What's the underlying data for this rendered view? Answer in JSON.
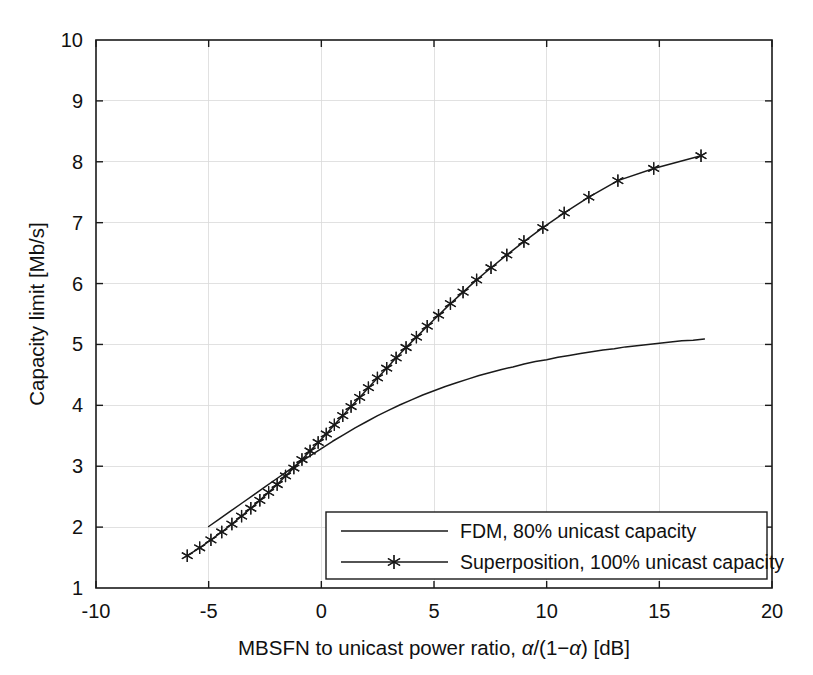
{
  "chart_data": {
    "type": "line",
    "title": "",
    "xlabel": "MBSFN to unicast power ratio, α/(1−α) [dB]",
    "ylabel": "Capacity limit [Mb/s]",
    "xlim": [
      -10,
      20
    ],
    "ylim": [
      1,
      10
    ],
    "xticks": [
      -10,
      -5,
      0,
      5,
      10,
      15,
      20
    ],
    "yticks": [
      1,
      2,
      3,
      4,
      5,
      6,
      7,
      8,
      9,
      10
    ],
    "grid": true,
    "legend_position": "lower right",
    "series": [
      {
        "name": "FDM, 80% unicast capacity",
        "marker": "none",
        "color": "#1a1a1a",
        "x": [
          -5.0,
          -4.5,
          -4.0,
          -3.5,
          -3.0,
          -2.5,
          -2.0,
          -1.5,
          -1.0,
          -0.5,
          0.0,
          0.5,
          1.0,
          1.5,
          2.0,
          2.5,
          3.0,
          3.5,
          4.0,
          4.5,
          5.0,
          5.5,
          6.0,
          6.5,
          7.0,
          7.5,
          8.0,
          8.5,
          9.0,
          9.5,
          10.0,
          10.5,
          11.0,
          11.5,
          12.0,
          12.5,
          13.0,
          13.5,
          14.0,
          14.5,
          15.0,
          15.5,
          16.0,
          16.5,
          17.0
        ],
        "y": [
          2.01,
          2.14,
          2.27,
          2.4,
          2.53,
          2.66,
          2.79,
          2.92,
          3.05,
          3.17,
          3.29,
          3.41,
          3.52,
          3.63,
          3.73,
          3.83,
          3.92,
          4.01,
          4.09,
          4.17,
          4.24,
          4.31,
          4.37,
          4.43,
          4.49,
          4.54,
          4.59,
          4.63,
          4.68,
          4.72,
          4.75,
          4.79,
          4.82,
          4.85,
          4.88,
          4.91,
          4.93,
          4.96,
          4.98,
          5.0,
          5.02,
          5.04,
          5.06,
          5.07,
          5.09
        ]
      },
      {
        "name": "Superposition, 100% unicast capacity",
        "marker": "star",
        "color": "#1a1a1a",
        "x": [
          -5.95,
          -5.4,
          -4.9,
          -4.42,
          -3.97,
          -3.54,
          -3.13,
          -2.73,
          -2.34,
          -1.96,
          -1.59,
          -1.22,
          -0.86,
          -0.5,
          -0.14,
          0.22,
          0.58,
          0.95,
          1.32,
          1.7,
          2.09,
          2.49,
          2.9,
          3.32,
          3.76,
          4.22,
          4.7,
          5.2,
          5.73,
          6.29,
          6.89,
          7.53,
          8.23,
          8.99,
          9.83,
          10.78,
          11.87,
          13.16,
          14.75,
          16.85
        ],
        "y": [
          1.53,
          1.66,
          1.79,
          1.92,
          2.05,
          2.18,
          2.31,
          2.44,
          2.57,
          2.7,
          2.84,
          2.97,
          3.11,
          3.25,
          3.39,
          3.53,
          3.68,
          3.83,
          3.98,
          4.13,
          4.29,
          4.45,
          4.61,
          4.78,
          4.95,
          5.12,
          5.3,
          5.48,
          5.67,
          5.86,
          6.06,
          6.26,
          6.47,
          6.69,
          6.92,
          7.16,
          7.42,
          7.69,
          7.89,
          8.1
        ]
      }
    ]
  },
  "axes": {
    "y_title": "Capacity limit [Mb/s]",
    "x_title_part1": "MBSFN to unicast power ratio, ",
    "x_title_alpha1": "α",
    "x_title_mid": "/(1−",
    "x_title_alpha2": "α",
    "x_title_part2": ") [dB]",
    "y_tick_labels": [
      "10",
      "9",
      "8",
      "7",
      "6",
      "5",
      "4",
      "3",
      "2",
      "1"
    ],
    "x_tick_labels": [
      "-10",
      "-5",
      "0",
      "5",
      "10",
      "15",
      "20"
    ]
  },
  "legend": {
    "entries": [
      {
        "label": "FDM, 80% unicast capacity",
        "marker": "none"
      },
      {
        "label": "Superposition, 100% unicast capacity",
        "marker": "star"
      }
    ]
  },
  "style": {
    "axis_color": "#1a1a1a",
    "grid_color": "#d9d9d9",
    "line_color": "#1a1a1a",
    "background": "#ffffff"
  }
}
